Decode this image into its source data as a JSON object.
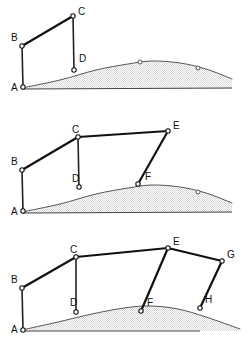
{
  "figure": {
    "width": 252,
    "height": 350,
    "background_color": "#ffffff",
    "beam_color": "#111111",
    "post_color": "#222222",
    "terrain_outline_color": "#555555",
    "terrain_fill_color": "#d6d6d6",
    "node_fill_color": "#ffffff",
    "label_color": "#111111"
  },
  "panels": [
    {
      "id": "stage-1",
      "name": "stage-1-panel",
      "offset_y": 0,
      "height": 112,
      "ground_line": {
        "x1": 22,
        "y1": 89,
        "x2": 232,
        "y2": 88
      },
      "terrain_profile": [
        [
          22,
          88
        ],
        [
          60,
          80
        ],
        [
          96,
          70
        ],
        [
          128,
          64
        ],
        [
          152,
          61
        ],
        [
          180,
          63
        ],
        [
          206,
          69
        ],
        [
          232,
          79
        ]
      ],
      "terrain_base_y": 89,
      "terrain_markers": [
        {
          "x": 140,
          "y": 62,
          "name": "terrain-marker-1"
        },
        {
          "x": 198,
          "y": 68,
          "name": "terrain-marker-2"
        }
      ],
      "beams": [
        {
          "name": "beam-bc",
          "from": "B",
          "to": "C"
        }
      ],
      "posts": [
        {
          "name": "post-ab",
          "from": "A",
          "to": "B"
        },
        {
          "name": "post-cd",
          "from": "C",
          "to": "D"
        }
      ],
      "nodes": [
        {
          "id": "A",
          "label": "A",
          "x": 23,
          "y": 87,
          "lx": 11,
          "ly": 91,
          "name": "node-a"
        },
        {
          "id": "B",
          "label": "B",
          "x": 22,
          "y": 46,
          "lx": 11,
          "ly": 41,
          "name": "node-b"
        },
        {
          "id": "C",
          "label": "C",
          "x": 73,
          "y": 16,
          "lx": 78,
          "ly": 15,
          "name": "node-c"
        },
        {
          "id": "D",
          "label": "D",
          "x": 74,
          "y": 70,
          "lx": 79,
          "ly": 62,
          "name": "node-d"
        }
      ]
    },
    {
      "id": "stage-2",
      "name": "stage-2-panel",
      "offset_y": 116,
      "height": 112,
      "ground_line": {
        "x1": 22,
        "y1": 97,
        "x2": 232,
        "y2": 96
      },
      "terrain_profile": [
        [
          22,
          96
        ],
        [
          60,
          88
        ],
        [
          96,
          78
        ],
        [
          128,
          72
        ],
        [
          152,
          69
        ],
        [
          180,
          71
        ],
        [
          206,
          77
        ],
        [
          232,
          87
        ]
      ],
      "terrain_base_y": 97,
      "terrain_markers": [
        {
          "x": 198,
          "y": 76,
          "name": "terrain-marker-1"
        }
      ],
      "beams": [
        {
          "name": "beam-bc",
          "from": "B",
          "to": "C"
        },
        {
          "name": "beam-ce",
          "from": "C",
          "to": "E"
        },
        {
          "name": "beam-ef",
          "from": "E",
          "to": "F"
        }
      ],
      "posts": [
        {
          "name": "post-ab",
          "from": "A",
          "to": "B"
        },
        {
          "name": "post-cd",
          "from": "C",
          "to": "D"
        }
      ],
      "nodes": [
        {
          "id": "A",
          "label": "A",
          "x": 23,
          "y": 95,
          "lx": 11,
          "ly": 99,
          "name": "node-a"
        },
        {
          "id": "B",
          "label": "B",
          "x": 22,
          "y": 54,
          "lx": 11,
          "ly": 49,
          "name": "node-b"
        },
        {
          "id": "C",
          "label": "C",
          "x": 78,
          "y": 21,
          "lx": 72,
          "ly": 17,
          "name": "node-c"
        },
        {
          "id": "D",
          "label": "D",
          "x": 79,
          "y": 71,
          "lx": 72,
          "ly": 66,
          "name": "node-d"
        },
        {
          "id": "E",
          "label": "E",
          "x": 168,
          "y": 15,
          "lx": 173,
          "ly": 13,
          "name": "node-e"
        },
        {
          "id": "F",
          "label": "F",
          "x": 138,
          "y": 68,
          "lx": 145,
          "ly": 64,
          "name": "node-f"
        }
      ]
    },
    {
      "id": "stage-3",
      "name": "stage-3-panel",
      "offset_y": 232,
      "height": 118,
      "ground_line": {
        "x1": 22,
        "y1": 99,
        "x2": 200,
        "y2": 99
      },
      "terrain_profile": [
        [
          22,
          98
        ],
        [
          58,
          90
        ],
        [
          92,
          82
        ],
        [
          124,
          76
        ],
        [
          150,
          74
        ],
        [
          178,
          77
        ],
        [
          206,
          85
        ],
        [
          240,
          97
        ]
      ],
      "terrain_base_y": 99,
      "terrain_markers": [],
      "beams": [
        {
          "name": "beam-bc",
          "from": "B",
          "to": "C"
        },
        {
          "name": "beam-ce",
          "from": "C",
          "to": "E"
        },
        {
          "name": "beam-ef",
          "from": "E",
          "to": "F"
        },
        {
          "name": "beam-eg",
          "from": "E",
          "to": "G"
        },
        {
          "name": "beam-gh",
          "from": "G",
          "to": "H"
        }
      ],
      "posts": [
        {
          "name": "post-ab",
          "from": "A",
          "to": "B"
        },
        {
          "name": "post-cd",
          "from": "C",
          "to": "D"
        }
      ],
      "nodes": [
        {
          "id": "A",
          "label": "A",
          "x": 23,
          "y": 98,
          "lx": 11,
          "ly": 101,
          "name": "node-a"
        },
        {
          "id": "B",
          "label": "B",
          "x": 22,
          "y": 56,
          "lx": 11,
          "ly": 51,
          "name": "node-b"
        },
        {
          "id": "C",
          "label": "C",
          "x": 76,
          "y": 25,
          "lx": 70,
          "ly": 21,
          "name": "node-c"
        },
        {
          "id": "D",
          "label": "D",
          "x": 76,
          "y": 80,
          "lx": 70,
          "ly": 74,
          "name": "node-d"
        },
        {
          "id": "E",
          "label": "E",
          "x": 168,
          "y": 16,
          "lx": 173,
          "ly": 13,
          "name": "node-e"
        },
        {
          "id": "F",
          "label": "F",
          "x": 141,
          "y": 79,
          "lx": 147,
          "ly": 74,
          "name": "node-f"
        },
        {
          "id": "G",
          "label": "G",
          "x": 222,
          "y": 29,
          "lx": 227,
          "ly": 26,
          "name": "node-g"
        },
        {
          "id": "H",
          "label": "H",
          "x": 200,
          "y": 76,
          "lx": 205,
          "ly": 71,
          "name": "node-h"
        }
      ]
    }
  ]
}
